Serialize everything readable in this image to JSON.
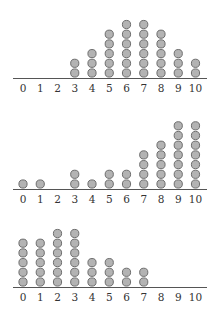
{
  "chart_data": [
    {
      "type": "dot",
      "title": "",
      "xlabel": "",
      "ylabel": "",
      "categories": [
        "0",
        "1",
        "2",
        "3",
        "4",
        "5",
        "6",
        "7",
        "8",
        "9",
        "10"
      ],
      "values": [
        0,
        0,
        0,
        2,
        3,
        5,
        6,
        6,
        5,
        3,
        2
      ],
      "grid": false
    },
    {
      "type": "dot",
      "title": "",
      "xlabel": "",
      "ylabel": "",
      "categories": [
        "0",
        "1",
        "2",
        "3",
        "4",
        "5",
        "6",
        "7",
        "8",
        "9",
        "10"
      ],
      "values": [
        1,
        1,
        0,
        2,
        1,
        2,
        2,
        4,
        5,
        7,
        7
      ],
      "grid": false
    },
    {
      "type": "dot",
      "title": "",
      "xlabel": "",
      "ylabel": "",
      "categories": [
        "0",
        "1",
        "2",
        "3",
        "4",
        "5",
        "6",
        "7",
        "8",
        "9",
        "10"
      ],
      "values": [
        5,
        5,
        6,
        6,
        3,
        3,
        2,
        2,
        0,
        0,
        0
      ],
      "grid": false
    }
  ],
  "style": {
    "dot_fill": "#b3b3b3",
    "dot_stroke": "#6e6e6e",
    "axis_color": "#555555"
  }
}
